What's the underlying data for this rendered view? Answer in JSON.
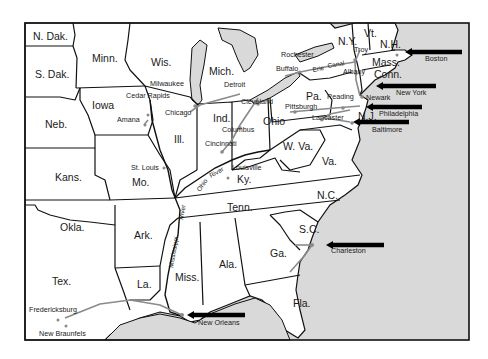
{
  "map": {
    "colors": {
      "land": "#ffffff",
      "water": "#d9d9d9",
      "border": "#111111",
      "route": "#8a8a8a",
      "arrow": "#000000"
    },
    "states": [
      {
        "label": "N. Dak.",
        "x": 33,
        "y": 40
      },
      {
        "label": "S. Dak.",
        "x": 35,
        "y": 78
      },
      {
        "label": "Minn.",
        "x": 92,
        "y": 62
      },
      {
        "label": "Wis.",
        "x": 151,
        "y": 66
      },
      {
        "label": "Mich.",
        "x": 209,
        "y": 75
      },
      {
        "label": "Iowa",
        "x": 92,
        "y": 109
      },
      {
        "label": "Neb.",
        "x": 45,
        "y": 128
      },
      {
        "label": "Ill.",
        "x": 174,
        "y": 143
      },
      {
        "label": "Ind.",
        "x": 213,
        "y": 122
      },
      {
        "label": "Ohio",
        "x": 263,
        "y": 125
      },
      {
        "label": "Pa.",
        "x": 306,
        "y": 100
      },
      {
        "label": "N.Y.",
        "x": 338,
        "y": 45
      },
      {
        "label": "Vt.",
        "x": 364,
        "y": 37
      },
      {
        "label": "N.H.",
        "x": 380,
        "y": 48
      },
      {
        "label": "Mass.",
        "x": 372,
        "y": 66
      },
      {
        "label": "Conn.",
        "x": 374,
        "y": 78
      },
      {
        "label": "N.J.",
        "x": 358,
        "y": 120
      },
      {
        "label": "W. Va.",
        "x": 283,
        "y": 150
      },
      {
        "label": "Va.",
        "x": 322,
        "y": 165
      },
      {
        "label": "Ky.",
        "x": 237,
        "y": 183
      },
      {
        "label": "Kans.",
        "x": 55,
        "y": 181
      },
      {
        "label": "Mo.",
        "x": 132,
        "y": 186
      },
      {
        "label": "Tenn.",
        "x": 227,
        "y": 211
      },
      {
        "label": "N.C.",
        "x": 317,
        "y": 199
      },
      {
        "label": "Okla.",
        "x": 60,
        "y": 231
      },
      {
        "label": "Ark.",
        "x": 134,
        "y": 239
      },
      {
        "label": "S.C.",
        "x": 299,
        "y": 233
      },
      {
        "label": "Ga.",
        "x": 270,
        "y": 257
      },
      {
        "label": "Ala.",
        "x": 219,
        "y": 268
      },
      {
        "label": "Miss.",
        "x": 175,
        "y": 281
      },
      {
        "label": "Tex.",
        "x": 52,
        "y": 285
      },
      {
        "label": "La.",
        "x": 137,
        "y": 288
      },
      {
        "label": "Fla.",
        "x": 293,
        "y": 307
      }
    ],
    "cities": [
      {
        "label": "Milwaukee",
        "x": 150,
        "y": 86
      },
      {
        "label": "Cedar Rapids",
        "x": 126,
        "y": 98
      },
      {
        "label": "Amana",
        "x": 117,
        "y": 122
      },
      {
        "label": "Chicago",
        "x": 165,
        "y": 115
      },
      {
        "label": "Detroit",
        "x": 224,
        "y": 87
      },
      {
        "label": "Cleveland",
        "x": 241,
        "y": 104
      },
      {
        "label": "Columbus",
        "x": 222,
        "y": 132
      },
      {
        "label": "Cincinnati",
        "x": 205,
        "y": 146
      },
      {
        "label": "Louisville",
        "x": 232,
        "y": 170
      },
      {
        "label": "St. Louis",
        "x": 131,
        "y": 170
      },
      {
        "label": "Rochester",
        "x": 281,
        "y": 57
      },
      {
        "label": "Buffalo",
        "x": 276,
        "y": 71
      },
      {
        "label": "Troy",
        "x": 354,
        "y": 52
      },
      {
        "label": "Albany",
        "x": 343,
        "y": 74
      },
      {
        "label": "Reading",
        "x": 327,
        "y": 99
      },
      {
        "label": "Newark",
        "x": 366,
        "y": 100
      },
      {
        "label": "Pittsburgh",
        "x": 285,
        "y": 109
      },
      {
        "label": "Lancaster",
        "x": 312,
        "y": 120
      },
      {
        "label": "Boston",
        "x": 425,
        "y": 61
      },
      {
        "label": "New York",
        "x": 396,
        "y": 95
      },
      {
        "label": "Philadelphia",
        "x": 379,
        "y": 116
      },
      {
        "label": "Baltimore",
        "x": 372,
        "y": 132
      },
      {
        "label": "Charleston",
        "x": 331,
        "y": 253
      },
      {
        "label": "Fredericksburg",
        "x": 29,
        "y": 312
      },
      {
        "label": "New Braunfels",
        "x": 39,
        "y": 336
      },
      {
        "label": "New Orleans",
        "x": 198,
        "y": 325
      }
    ],
    "features": [
      {
        "label": "Erie",
        "x": 313,
        "y": 72,
        "rotate": -10
      },
      {
        "label": "Canal",
        "x": 328,
        "y": 68,
        "rotate": -10
      },
      {
        "label": "Ohio",
        "x": 200,
        "y": 192,
        "rotate": -55
      },
      {
        "label": "River",
        "x": 211,
        "y": 178,
        "rotate": -30
      },
      {
        "label": "Mississippi",
        "x": 173,
        "y": 268,
        "rotate": -80
      },
      {
        "label": "River",
        "x": 183,
        "y": 220,
        "rotate": -80
      }
    ],
    "ports": [
      {
        "name": "Boston",
        "arrow": {
          "x1": 462,
          "y1": 52,
          "x2": 405,
          "y2": 52
        }
      },
      {
        "name": "New York",
        "arrow": {
          "x1": 436,
          "y1": 86,
          "x2": 376,
          "y2": 86
        }
      },
      {
        "name": "Philadelphia",
        "arrow": {
          "x1": 422,
          "y1": 107,
          "x2": 366,
          "y2": 107
        }
      },
      {
        "name": "Baltimore",
        "arrow": {
          "x1": 409,
          "y1": 122,
          "x2": 353,
          "y2": 122
        }
      },
      {
        "name": "Charleston",
        "arrow": {
          "x1": 384,
          "y1": 245,
          "x2": 326,
          "y2": 245
        }
      },
      {
        "name": "New Orleans",
        "arrow": {
          "x1": 245,
          "y1": 315,
          "x2": 187,
          "y2": 315
        }
      }
    ]
  }
}
